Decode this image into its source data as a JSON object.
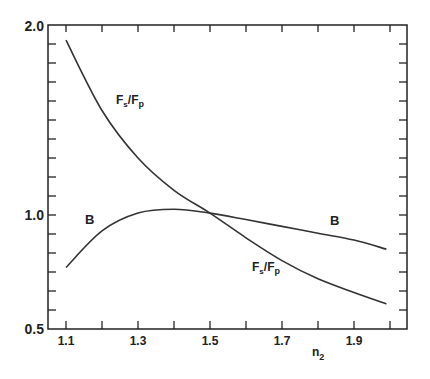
{
  "chart_data": {
    "type": "line",
    "title": "",
    "xlabel": "n",
    "xlabel_subscript": "2",
    "ylabel": "",
    "xlim": [
      1.05,
      2.0
    ],
    "ylim": [
      0.5,
      2.0
    ],
    "x_ticks": [
      "1.1",
      "1.3",
      "1.5",
      "1.7",
      "1.9"
    ],
    "y_ticks": [
      "0.5",
      "1.0",
      "2.0"
    ],
    "grid": false,
    "series": [
      {
        "name": "Fs/Fp",
        "x": [
          1.1,
          1.2,
          1.3,
          1.4,
          1.5,
          1.6,
          1.7,
          1.8,
          1.9,
          1.99
        ],
        "values": [
          1.92,
          1.55,
          1.3,
          1.13,
          1.01,
          0.9,
          0.8,
          0.72,
          0.66,
          0.61
        ]
      },
      {
        "name": "B",
        "x": [
          1.1,
          1.2,
          1.3,
          1.4,
          1.5,
          1.6,
          1.7,
          1.8,
          1.9,
          1.99
        ],
        "values": [
          0.77,
          0.93,
          1.01,
          1.03,
          1.01,
          0.98,
          0.95,
          0.92,
          0.89,
          0.85
        ]
      }
    ],
    "annotations": [
      {
        "text": "Fs/Fp",
        "near": [
          1.27,
          1.45
        ]
      },
      {
        "text": "B",
        "near": [
          1.18,
          0.97
        ]
      },
      {
        "text": "B",
        "near": [
          1.82,
          0.96
        ]
      },
      {
        "text": "Fs/Fp",
        "near": [
          1.74,
          0.74
        ]
      }
    ]
  },
  "labels": {
    "y_top": "2.0",
    "y_mid": "1.0",
    "y_bottom": "0.5",
    "x1": "1.1",
    "x2": "1.3",
    "x3": "1.5",
    "x4": "1.7",
    "x5": "1.9",
    "xlabel": "n",
    "xlabel_sub": "2",
    "curve_b": "B",
    "F": "F",
    "s": "s",
    "p": "p",
    "slash": "/"
  }
}
